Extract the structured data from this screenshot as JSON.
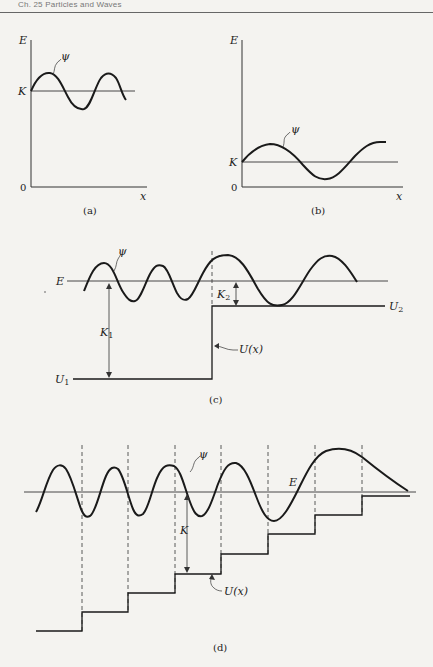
{
  "page": {
    "running_header": "Ch. 25   Particles and Waves"
  },
  "figure": {
    "panels": [
      {
        "id": "a",
        "caption": "(a)",
        "axis_labels": {
          "y": "E",
          "x": "x",
          "origin": "0"
        },
        "line_label": "K",
        "wave_label": "ψ",
        "description": "Short-wavelength wave centered on kinetic energy level K (large K)"
      },
      {
        "id": "b",
        "caption": "(b)",
        "axis_labels": {
          "y": "E",
          "x": "x",
          "origin": "0"
        },
        "line_label": "K",
        "wave_label": "ψ",
        "description": "Long-wavelength wave centered on small kinetic energy K"
      },
      {
        "id": "c",
        "caption": "(c)",
        "energy_label": "E",
        "wave_label": "ψ",
        "potential_label": "U(x)",
        "levels": {
          "low": "U",
          "low_sub": "1",
          "high": "U",
          "high_sub": "2"
        },
        "kinetic": [
          {
            "label": "K",
            "sub": "1"
          },
          {
            "label": "K",
            "sub": "2"
          }
        ],
        "description": "Wave crossing a potential step: wavelength increases where U rises"
      },
      {
        "id": "d",
        "caption": "(d)",
        "energy_label": "E",
        "wave_label": "ψ",
        "potential_label": "U(x)",
        "kinetic_label": "K",
        "steps": 8,
        "description": "Wave over staircase potential: wavelength grows as K decreases"
      }
    ]
  }
}
